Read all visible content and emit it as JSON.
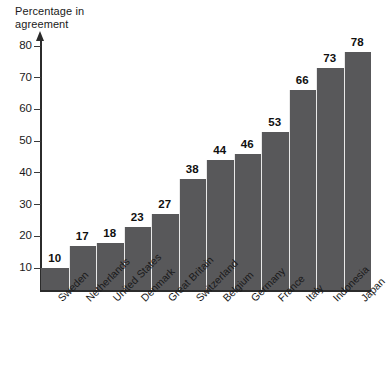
{
  "chart_data": {
    "type": "bar",
    "title": "",
    "subtitle": "",
    "xlabel": "",
    "ylabel": "Percentage in\nagreement",
    "ylim": [
      0,
      85
    ],
    "yticks": [
      10,
      20,
      30,
      40,
      50,
      60,
      70,
      80
    ],
    "ytick_labels": [
      "10",
      "20",
      "30",
      "40",
      "50",
      "60",
      "70",
      "80"
    ],
    "grid": false,
    "legend": false,
    "bar_color": "#58585a",
    "categories": [
      "Sweden",
      "Netherlands",
      "United States",
      "Denmark",
      "Great Britain",
      "Switzerland",
      "Belgium",
      "Germany",
      "France",
      "Italy",
      "Indonesia",
      "Japan"
    ],
    "values": [
      10,
      17,
      18,
      23,
      27,
      38,
      44,
      46,
      53,
      66,
      73,
      78
    ],
    "value_labels": [
      "10",
      "17",
      "18",
      "23",
      "27",
      "38",
      "44",
      "46",
      "53",
      "66",
      "73",
      "78"
    ]
  }
}
